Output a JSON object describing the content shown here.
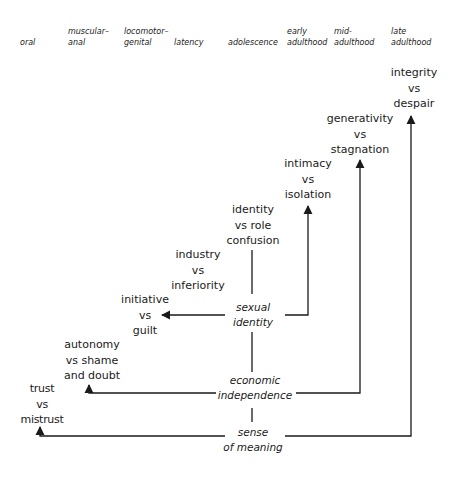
{
  "stages": [
    {
      "id": "oral",
      "lines": [
        "",
        "oral"
      ]
    },
    {
      "id": "muscular-anal",
      "lines": [
        "muscular–",
        "anal"
      ]
    },
    {
      "id": "locomotor-genital",
      "lines": [
        "locomotor–",
        "genital"
      ]
    },
    {
      "id": "latency",
      "lines": [
        "",
        "latency"
      ]
    },
    {
      "id": "adolescence",
      "lines": [
        "",
        "adolescence"
      ]
    },
    {
      "id": "early-adulthood",
      "lines": [
        "early",
        "adulthood"
      ]
    },
    {
      "id": "mid-adulthood",
      "lines": [
        "mid-",
        "adulthood"
      ]
    },
    {
      "id": "late-adulthood",
      "lines": [
        "late",
        "adulthood"
      ]
    }
  ],
  "crises": [
    {
      "id": "trust-vs-mistrust",
      "lines": [
        "trust",
        "vs",
        "mistrust"
      ]
    },
    {
      "id": "autonomy-vs-shame",
      "lines": [
        "autonomy",
        "vs shame",
        "and doubt"
      ]
    },
    {
      "id": "initiative-vs-guilt",
      "lines": [
        "initiative",
        "vs",
        "guilt"
      ]
    },
    {
      "id": "industry-vs-inferiority",
      "lines": [
        "industry",
        "vs",
        "inferiority"
      ]
    },
    {
      "id": "identity-vs-role-confusion",
      "lines": [
        "identity",
        "vs role",
        "confusion"
      ]
    },
    {
      "id": "intimacy-vs-isolation",
      "lines": [
        "intimacy",
        "vs",
        "isolation"
      ]
    },
    {
      "id": "generativity-vs-stagnation",
      "lines": [
        "generativity",
        "vs",
        "stagnation"
      ]
    },
    {
      "id": "integrity-vs-despair",
      "lines": [
        "integrity",
        "vs",
        "despair"
      ]
    }
  ],
  "hubs": [
    {
      "id": "sexual-identity",
      "lines": [
        "sexual",
        "identity"
      ]
    },
    {
      "id": "economic-independence",
      "lines": [
        "economic",
        "independence"
      ]
    },
    {
      "id": "sense-of-meaning",
      "lines": [
        "sense",
        "of meaning"
      ]
    }
  ],
  "colors": {
    "line": "#1a1a1a",
    "background": "#ffffff"
  }
}
